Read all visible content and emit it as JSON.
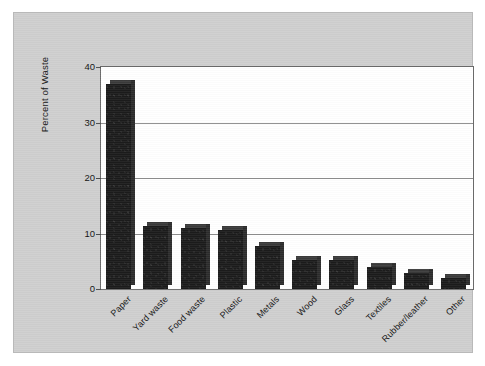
{
  "figure": {
    "y_axis_title": "Percent of Waste",
    "background_color": "#cfcfcf",
    "plot_background_color": "#ffffff",
    "bar_color": "#1b1b1b",
    "gridline_color": "#8d8d8d",
    "axis_color": "#6a6a6a"
  },
  "chart_data": {
    "type": "bar",
    "title": "",
    "xlabel": "",
    "ylabel": "Percent of Waste",
    "ylim": [
      0,
      40
    ],
    "yticks": [
      0,
      10,
      20,
      30,
      40
    ],
    "ytick_labels": [
      "0",
      "10",
      "20",
      "30",
      "40"
    ],
    "grid": true,
    "grid_axis": "y",
    "legend": false,
    "orientation": "vertical",
    "categories": [
      "Paper",
      "Yard waste",
      "Food waste",
      "Plastic",
      "Metals",
      "Wood",
      "Glass",
      "Textiles",
      "Rubber/leather",
      "Other"
    ],
    "values": [
      37.0,
      11.4,
      11.0,
      10.6,
      7.8,
      5.2,
      5.2,
      4.0,
      2.8,
      1.9
    ]
  }
}
